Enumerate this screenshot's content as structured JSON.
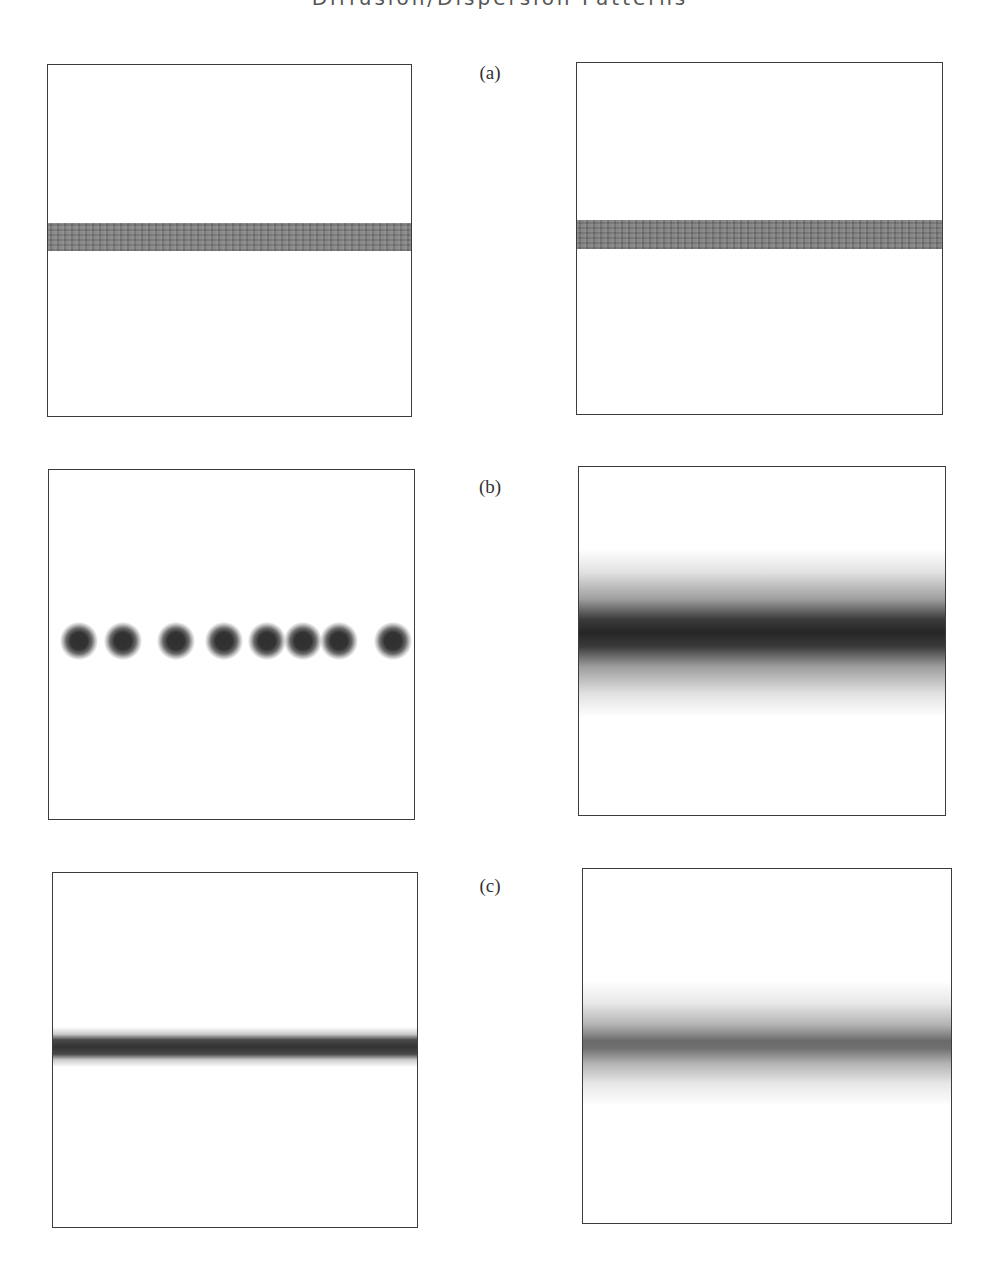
{
  "figure": {
    "title_clipped": "Diffusion/Dispersion Patterns",
    "labels": {
      "a": "(a)",
      "b": "(b)",
      "c": "(c)"
    },
    "rows": [
      {
        "id": "a",
        "left_panel": {
          "description": "uniform horizontal gray band",
          "band_top": 223,
          "band_bottom": 251,
          "band_color": "#7a7a7a"
        },
        "right_panel": {
          "description": "uniform horizontal gray band",
          "band_top": 220,
          "band_bottom": 249,
          "band_color": "#767676"
        }
      },
      {
        "id": "b",
        "left_panel": {
          "description": "row of discrete dark blobs",
          "dot_count": 8,
          "dot_y": 640,
          "dot_x": [
            78,
            122,
            175,
            223,
            266,
            302,
            338,
            392
          ],
          "dot_color": "#2f2f2f"
        },
        "right_panel": {
          "description": "diffuse horizontal band with dark core",
          "band_top": 550,
          "band_bottom": 715,
          "core_y": 635,
          "core_color": "#2a2a2a"
        }
      },
      {
        "id": "c",
        "left_panel": {
          "description": "narrow dark band with soft edges",
          "band_top": 1026,
          "band_bottom": 1066,
          "core_y": 1046,
          "core_color": "#3a3a3a"
        },
        "right_panel": {
          "description": "wide diffuse band, moderate gray core",
          "band_top": 980,
          "band_bottom": 1105,
          "core_y": 1040,
          "core_color": "#6a6a6a"
        }
      }
    ]
  }
}
